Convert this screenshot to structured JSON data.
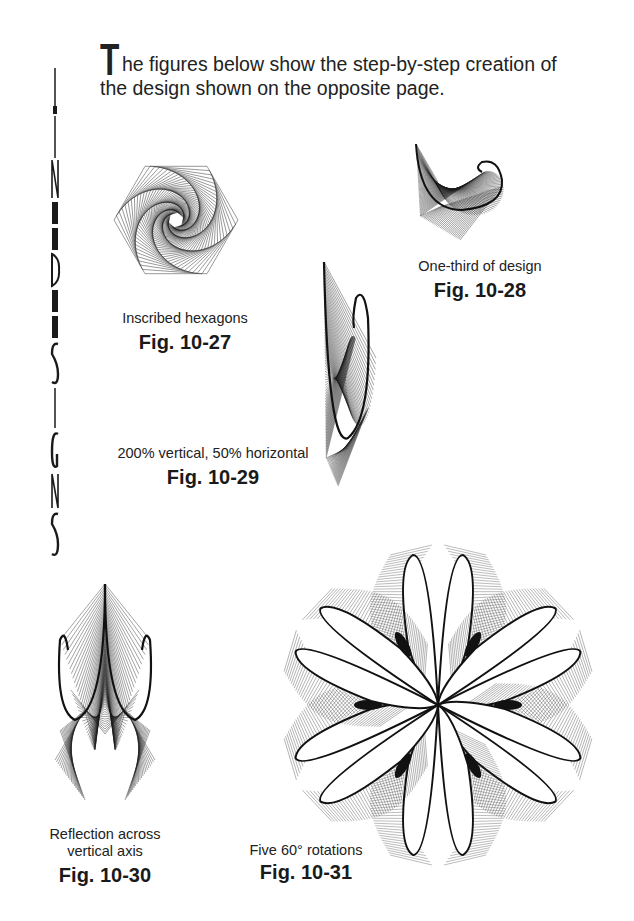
{
  "side_title": {
    "text": "LINEDESIGNS",
    "letters": [
      "L",
      "I",
      "N",
      "E",
      "D",
      "E",
      "S",
      "I",
      "G",
      "N",
      "S"
    ]
  },
  "intro": {
    "dropcap": "T",
    "text": "he figures below show the step-by-step creation of the design shown on the opposite page."
  },
  "figures": [
    {
      "id": "fig-10-27",
      "caption": "Inscribed hexagons",
      "label": "Fig. 10-27"
    },
    {
      "id": "fig-10-28",
      "caption": "One-third of design",
      "label": "Fig. 10-28"
    },
    {
      "id": "fig-10-29",
      "caption": "200% vertical, 50% horizontal",
      "label": "Fig. 10-29"
    },
    {
      "id": "fig-10-30",
      "caption_line1": "Reflection across",
      "caption_line2": "vertical axis",
      "label": "Fig. 10-30"
    },
    {
      "id": "fig-10-31",
      "caption": "Five 60°  rotations",
      "label": "Fig. 10-31"
    }
  ],
  "colors": {
    "ink": "#1a1a1a",
    "background": "#ffffff"
  }
}
